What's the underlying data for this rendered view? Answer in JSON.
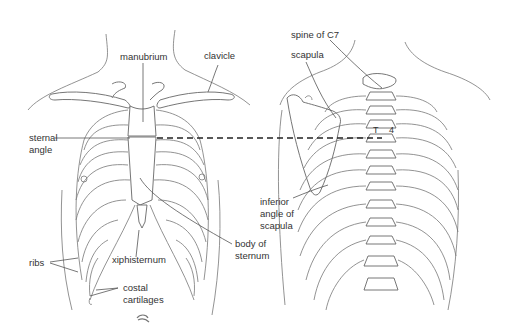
{
  "figure": {
    "anterior_view": {
      "labels": {
        "manubrium": "manubrium",
        "clavicle": "clavicle",
        "sternal_angle_1": "sternal",
        "sternal_angle_2": "angle",
        "ribs": "ribs",
        "xiphisternum": "xiphisternum",
        "body_of_sternum_1": "body of",
        "body_of_sternum_2": "sternum",
        "costal_cartilages_1": "costal",
        "costal_cartilages_2": "cartilages"
      }
    },
    "posterior_view": {
      "labels": {
        "spine_of_c7": "spine of C7",
        "scapula": "scapula",
        "inferior_angle_1": "inferior",
        "inferior_angle_2": "angle of",
        "inferior_angle_3": "scapula",
        "t4_t": "T",
        "t4_4": "4"
      }
    },
    "colors": {
      "line": "#666666",
      "text": "#333333",
      "background": "#ffffff"
    }
  }
}
